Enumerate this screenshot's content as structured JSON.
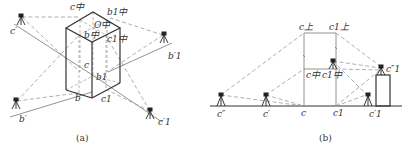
{
  "figure_a": {
    "caption": "(a)",
    "labels": {
      "c_mid": "c中",
      "b1_mid": "b1中",
      "O_mid": "O中",
      "b_mid": "b中",
      "c1_mid": "c1中",
      "c": "c",
      "b1": "b1",
      "b": "b",
      "c1": "c1",
      "c_prime": "c′",
      "b1_prime": "b′1",
      "b_prime": "b′",
      "c1_prime": "c′1"
    }
  },
  "figure_b": {
    "caption": "(b)",
    "labels": {
      "c_top": "c上",
      "c1_top": "c1上",
      "c_mid": "c中",
      "c1_mid": "c1中",
      "c": "c",
      "c1": "c1",
      "c_double_prime": "c″",
      "c_prime": "c′",
      "c1_prime": "c′1",
      "c1_double_prime": "c″1"
    }
  },
  "colors": {
    "line": "#333333",
    "dashed": "#999999",
    "background": "#ffffff"
  }
}
